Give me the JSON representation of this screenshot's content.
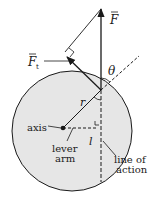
{
  "diagram": {
    "labels": {
      "force": "F",
      "tangential_force": "F",
      "tangential_subscript": "t",
      "angle": "θ",
      "radius": "r",
      "axis": "axis",
      "lever_arm_line1": "lever",
      "lever_arm_line2": "arm",
      "lever_arm_symbol": "l",
      "line_of_action_line1": "line of",
      "line_of_action_line2": "action"
    },
    "colors": {
      "disk_fill": "#e6e6e6",
      "stroke": "#1a1a1a",
      "background": "#ffffff"
    }
  }
}
